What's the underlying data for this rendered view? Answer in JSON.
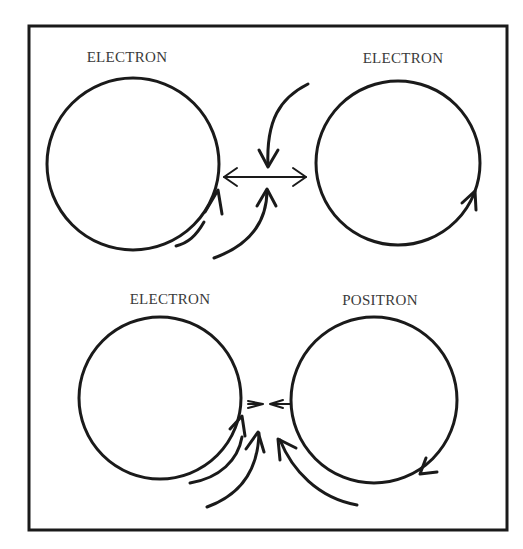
{
  "figure": {
    "frame_color": "#1a1a1a",
    "background": "#ffffff",
    "panels": [
      {
        "id": "top",
        "description": "Two electrons with same spin direction repel",
        "particles": [
          {
            "label": "ELECTRON",
            "rotation": "counter-clockwise"
          },
          {
            "label": "ELECTRON",
            "rotation": "counter-clockwise"
          }
        ],
        "interaction": "repulsion (double-headed outward arrow)"
      },
      {
        "id": "bottom",
        "description": "Electron and positron with opposite spin attract",
        "particles": [
          {
            "label": "ELECTRON",
            "rotation": "counter-clockwise"
          },
          {
            "label": "POSITRON",
            "rotation": "clockwise"
          }
        ],
        "interaction": "attraction (inward arrows)"
      }
    ]
  },
  "labels": {
    "top_left": "ELECTRON",
    "top_right": "ELECTRON",
    "bottom_left": "ELECTRON",
    "bottom_right": "POSITRON"
  }
}
